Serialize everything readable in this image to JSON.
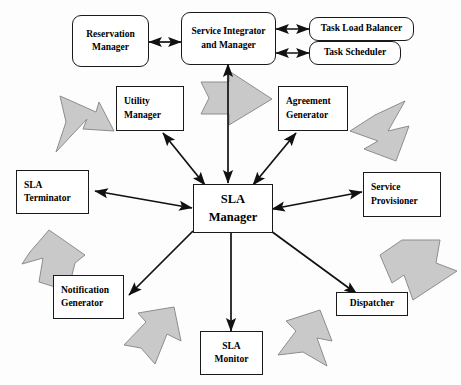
{
  "diagram": {
    "canvas": {
      "width": 461,
      "height": 385
    },
    "colors": {
      "background": "#ffffff",
      "box_border": "#1a1a1a",
      "box_fill": "#ffffff",
      "connector": "#111111",
      "decor_arrow_fill": "#c9c9c9",
      "decor_arrow_stroke": "#8d8d8d"
    },
    "nodes": {
      "reservation_manager": {
        "line1": "Reservation",
        "line2": "Manager"
      },
      "service_integrator": {
        "line1": "Service Integrator",
        "line2": "and Manager"
      },
      "task_load_balancer": {
        "line1": "Task Load Balancer"
      },
      "task_scheduler": {
        "line1": "Task Scheduler"
      },
      "utility_manager": {
        "line1": "Utility",
        "line2": "Manager"
      },
      "agreement_generator": {
        "line1": "Agreement",
        "line2": "Generator"
      },
      "sla_terminator": {
        "line1": "SLA",
        "line2": "Terminator"
      },
      "service_provisioner": {
        "line1": "Service",
        "line2": "Provisioner"
      },
      "sla_manager": {
        "line1": "SLA",
        "line2": "Manager"
      },
      "notification_generator": {
        "line1": "Notification",
        "line2": "Generator"
      },
      "dispatcher": {
        "line1": "Dispatcher"
      },
      "sla_monitor": {
        "line1": "SLA",
        "line2": "Monitor"
      }
    },
    "connectors": [
      {
        "name": "reservation-manager-to-service-integrator",
        "type": "double"
      },
      {
        "name": "service-integrator-to-task-load-balancer",
        "type": "double"
      },
      {
        "name": "service-integrator-to-task-scheduler",
        "type": "double"
      },
      {
        "name": "sla-manager-to-service-integrator",
        "type": "double"
      },
      {
        "name": "sla-manager-to-utility-manager",
        "type": "double"
      },
      {
        "name": "sla-manager-to-agreement-generator",
        "type": "double"
      },
      {
        "name": "sla-manager-to-sla-terminator",
        "type": "double"
      },
      {
        "name": "sla-manager-to-service-provisioner",
        "type": "double"
      },
      {
        "name": "sla-manager-to-notification-generator",
        "type": "single"
      },
      {
        "name": "sla-manager-to-dispatcher",
        "type": "single"
      },
      {
        "name": "sla-manager-to-sla-monitor",
        "type": "single"
      }
    ],
    "decorative_arrows": [
      {
        "name": "decor-arrow-upper-left",
        "direction": "up-left"
      },
      {
        "name": "decor-arrow-top-center",
        "direction": "right"
      },
      {
        "name": "decor-arrow-upper-right",
        "direction": "down-right"
      },
      {
        "name": "decor-arrow-left",
        "direction": "up"
      },
      {
        "name": "decor-arrow-right",
        "direction": "down"
      },
      {
        "name": "decor-arrow-lower-left",
        "direction": "up-left"
      },
      {
        "name": "decor-arrow-bottom-center",
        "direction": "left"
      },
      {
        "name": "decor-arrow-lower-right",
        "direction": "down-right"
      }
    ]
  }
}
